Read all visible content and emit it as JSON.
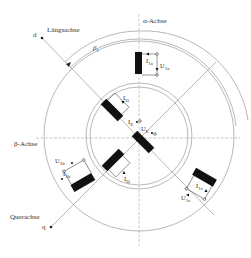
{
  "diagram": {
    "colors": {
      "line": "#9a9a9a",
      "axis": "#a8a8a8",
      "winding": "#111111",
      "text": "#333333",
      "background": "#ffffff"
    },
    "axes": {
      "alpha": {
        "label": "α-Achse"
      },
      "beta": {
        "label": "β-Achse"
      },
      "d": {
        "symbol": "d",
        "label": "Längsachse"
      },
      "q": {
        "symbol": "q",
        "label": "Querachse"
      },
      "angle": {
        "symbol": "β",
        "subscript": "1"
      }
    },
    "stator_windings": [
      {
        "id": "1a",
        "current": "I",
        "current_sub": "1a",
        "voltage": "U",
        "voltage_sub": "1a"
      },
      {
        "id": "1b",
        "current": "I",
        "current_sub": "1b",
        "voltage": "U",
        "voltage_sub": "1b"
      },
      {
        "id": "1c",
        "current": "I",
        "current_sub": "1c",
        "voltage": "U",
        "voltage_sub": "1c"
      }
    ],
    "rotor_windings": [
      {
        "id": "D",
        "current": "I",
        "current_sub": "D"
      },
      {
        "id": "E",
        "current": "I",
        "current_sub": "E",
        "voltage": "U",
        "voltage_sub": "E"
      },
      {
        "id": "Q",
        "current": "I",
        "current_sub": "Q"
      }
    ]
  }
}
